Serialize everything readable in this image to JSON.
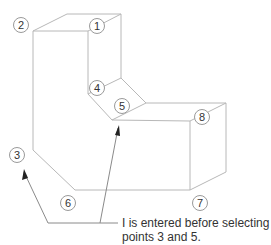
{
  "diagram": {
    "type": "isometric-solid",
    "point_labels": [
      {
        "id": "1",
        "x": 89,
        "y": 18
      },
      {
        "id": "2",
        "x": 15,
        "y": 18
      },
      {
        "id": "3",
        "x": 10,
        "y": 148
      },
      {
        "id": "4",
        "x": 89,
        "y": 80
      },
      {
        "id": "5",
        "x": 115,
        "y": 98
      },
      {
        "id": "6",
        "x": 61,
        "y": 194
      },
      {
        "id": "7",
        "x": 192,
        "y": 194
      },
      {
        "id": "8",
        "x": 194,
        "y": 109
      }
    ],
    "caption_line1": "I is entered before selecting",
    "caption_line2": "points 3 and 5."
  },
  "colors": {
    "line": "#b5b5b5",
    "leader": "#888888",
    "text": "#333333"
  }
}
